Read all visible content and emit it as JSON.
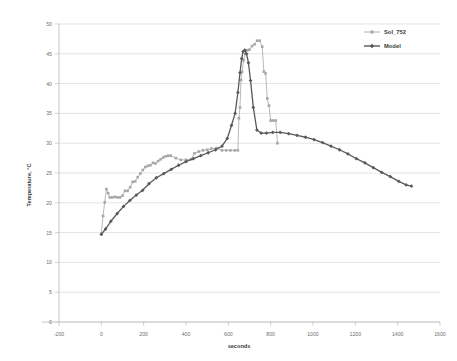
{
  "chart_data": {
    "type": "line",
    "title": "",
    "xlabel": "seconds",
    "ylabel": "Temperature, °C",
    "xlim": [
      -200,
      1600
    ],
    "ylim": [
      0,
      50
    ],
    "xticks": [
      -200,
      0,
      200,
      400,
      600,
      800,
      1000,
      1200,
      1400,
      1600
    ],
    "yticks": [
      0,
      5,
      10,
      15,
      20,
      25,
      30,
      35,
      40,
      45,
      50
    ],
    "grid": "horizontal",
    "legend_position": "top-right",
    "colors": {
      "sol_752": "#a6a6a6",
      "model": "#5a5a5a",
      "grid": "#d9d9d9",
      "axis": "#bfbfbf",
      "text": "#6f6f6f"
    },
    "series": [
      {
        "name": "Sol_752",
        "color": "#a6a6a6",
        "marker": "square",
        "x": [
          0,
          8,
          16,
          24,
          32,
          40,
          52,
          64,
          76,
          88,
          100,
          112,
          124,
          136,
          148,
          160,
          172,
          184,
          196,
          208,
          220,
          232,
          244,
          256,
          268,
          280,
          292,
          304,
          316,
          328,
          352,
          376,
          400,
          424,
          440,
          460,
          480,
          500,
          520,
          545,
          570,
          590,
          610,
          630,
          645,
          650,
          655,
          660,
          665,
          672,
          680,
          690,
          700,
          712,
          724,
          736,
          748,
          760,
          768,
          776,
          784,
          792,
          800,
          812,
          824,
          832
        ],
        "y": [
          14.8,
          17.8,
          20.1,
          22.3,
          21.6,
          20.9,
          20.9,
          21.0,
          20.9,
          20.9,
          21.2,
          22.0,
          22.0,
          22.6,
          23.5,
          23.6,
          24.3,
          24.9,
          25.5,
          26.0,
          26.2,
          26.3,
          26.7,
          26.6,
          27.0,
          27.3,
          27.6,
          27.8,
          27.9,
          27.9,
          27.5,
          27.2,
          27.2,
          27.3,
          28.3,
          28.6,
          28.8,
          28.9,
          29.1,
          29.2,
          28.8,
          28.8,
          28.8,
          28.8,
          28.8,
          34.2,
          36.0,
          40.6,
          42.0,
          43.9,
          45.0,
          45.6,
          45.7,
          46.3,
          46.6,
          47.2,
          47.2,
          46.2,
          42.0,
          41.7,
          37.5,
          36.3,
          33.8,
          33.8,
          33.8,
          30.0
        ]
      },
      {
        "name": "Model",
        "color": "#5a5a5a",
        "marker": "diamond",
        "x": [
          0,
          20,
          45,
          75,
          105,
          135,
          165,
          195,
          225,
          260,
          295,
          330,
          365,
          400,
          435,
          470,
          505,
          540,
          570,
          595,
          615,
          632,
          645,
          655,
          663,
          670,
          678,
          686,
          695,
          705,
          718,
          735,
          755,
          780,
          810,
          845,
          885,
          925,
          965,
          1005,
          1045,
          1085,
          1125,
          1165,
          1205,
          1245,
          1285,
          1325,
          1365,
          1405,
          1440,
          1465
        ],
        "y": [
          14.7,
          15.6,
          16.9,
          18.2,
          19.4,
          20.4,
          21.3,
          22.1,
          23.2,
          24.2,
          24.9,
          25.6,
          26.3,
          26.9,
          27.4,
          27.9,
          28.4,
          28.9,
          29.5,
          30.8,
          33.0,
          35.0,
          38.5,
          41.8,
          44.2,
          45.4,
          45.6,
          45.0,
          43.5,
          40.5,
          36.0,
          32.2,
          31.7,
          31.7,
          31.8,
          31.8,
          31.6,
          31.3,
          31.0,
          30.6,
          30.1,
          29.5,
          28.9,
          28.2,
          27.4,
          26.7,
          25.9,
          25.1,
          24.4,
          23.6,
          23.0,
          22.8
        ]
      }
    ]
  },
  "legend": {
    "items": [
      {
        "label": "Sol_752"
      },
      {
        "label": "Model"
      }
    ]
  },
  "axes": {
    "x_title": "seconds",
    "y_title": "Temperature, °C"
  }
}
